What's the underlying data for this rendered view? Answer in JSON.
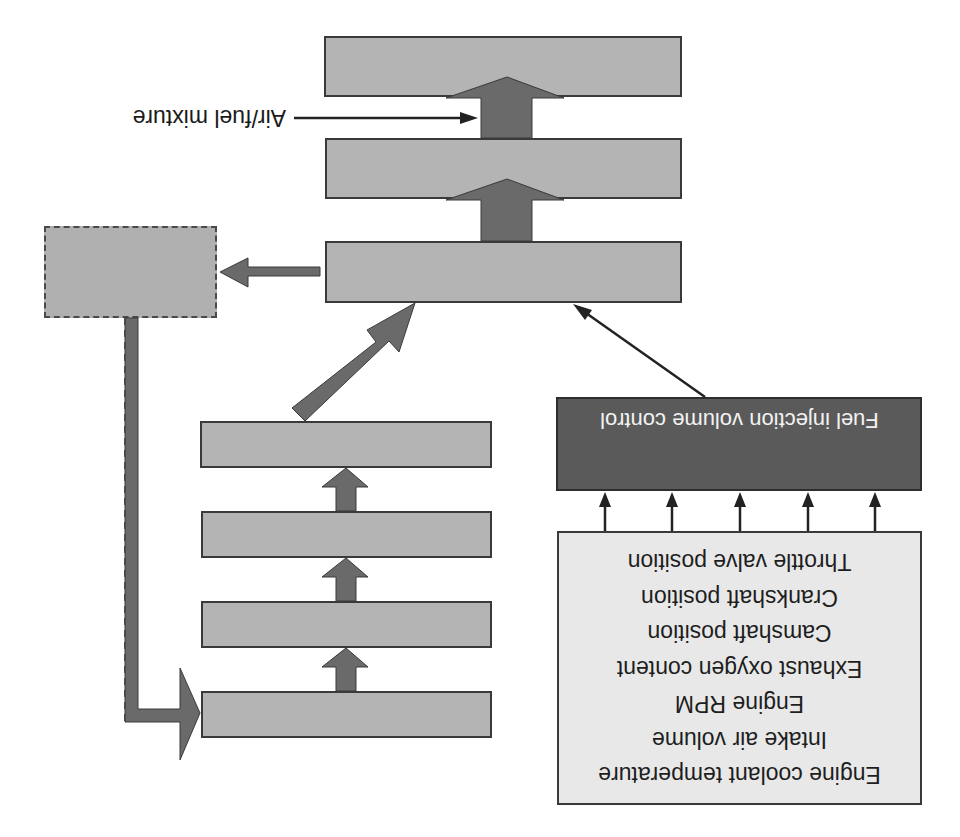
{
  "diagram": {
    "orientation": "rotated 180 degrees",
    "colors": {
      "stage_box_fill": "#b4b4b4",
      "controller_fill": "#5a5a5a",
      "sensor_box_fill": "#e8e8e8",
      "arrow_fill": "#6a6a6a",
      "outline": "#3a3a3a"
    },
    "annotations": {
      "air_fuel_label": "Air/fuel mixture"
    },
    "controller": {
      "label": "Fuel injection volume control"
    },
    "sensors": {
      "items": [
        "Engine coolant temperature",
        "Intake air volume",
        "Engine RPM",
        "Exhaust oxygen content",
        "Camshaft position",
        "Crankshaft position",
        "Throttle valve position"
      ]
    },
    "upper_stack": {
      "boxes": [
        "",
        "",
        ""
      ]
    },
    "lower_stack": {
      "boxes": [
        "",
        "",
        "",
        ""
      ]
    },
    "dashed_box": {
      "label": ""
    }
  }
}
